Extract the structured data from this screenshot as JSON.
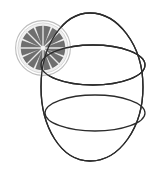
{
  "figure": {
    "caption": "",
    "background_color": "#ffffff",
    "canvas": {
      "width": 162,
      "height": 173
    }
  },
  "chart_data": {
    "type": "diagram",
    "background": "#ffffff",
    "shapes": [
      {
        "name": "egg-outline",
        "kind": "ovoid-outline",
        "label": "Egg / ovoid body outline",
        "stroke": "#2b2b2b",
        "stroke_width": 1.3,
        "fill": "none",
        "center": [
          92,
          87
        ],
        "radius_x": 51,
        "radius_y": 75,
        "top_point": [
          90,
          13
        ],
        "bottom_point": [
          90,
          161
        ],
        "left_extent": 41,
        "right_extent": 143,
        "narrow_end": "top"
      },
      {
        "name": "upper-cross-section-ellipse",
        "kind": "ellipse",
        "label": "Upper horizontal cross-section",
        "stroke": "#2b2b2b",
        "stroke_width": 1.3,
        "fill": "none",
        "center": [
          93,
          65
        ],
        "radius_x": 52,
        "radius_y": 20
      },
      {
        "name": "lower-cross-section-ellipse",
        "kind": "ellipse",
        "label": "Lower horizontal cross-section",
        "stroke": "#2b2b2b",
        "stroke_width": 1.3,
        "fill": "none",
        "center": [
          95,
          113
        ],
        "radius_x": 50,
        "radius_y": 18
      },
      {
        "name": "citrus-slice",
        "kind": "radial-segmented-disc",
        "label": "Citrus (lemon) cross-section slice",
        "center": [
          43,
          48
        ],
        "outer_radius": 28,
        "rind_outer_color": "#e3e3e3",
        "rind_outline_color": "#bdbdbd",
        "pith_color": "#f0f0f0",
        "flesh_color": "#6f6f6f",
        "flesh_outline_color": "#5a5a5a",
        "divider_color": "#e8e8e8",
        "segment_count": 8,
        "flesh_radius": 22,
        "segment_start_angle_deg": -90
      }
    ],
    "legend": [],
    "annotations": [],
    "axis": {
      "visible": false
    },
    "grid": false
  },
  "a11y": {
    "alt_text": "Line drawing of an egg-shaped solid crossed by two horizontal ellipses, with a gray segmented citrus slice overlapping the upper left."
  }
}
